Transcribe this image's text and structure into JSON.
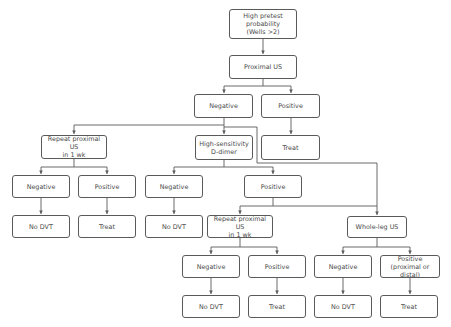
{
  "diagram": {
    "type": "flowchart",
    "line_color": "#5a5a5a",
    "text_color": "#4a4a4a",
    "nodes": [
      {
        "id": "start",
        "label": "High pretest\nprobability\n(Wells >2)",
        "x": 229,
        "y": 9,
        "w": 68,
        "h": 30
      },
      {
        "id": "proximal_us",
        "label": "Proximal US",
        "x": 229,
        "y": 55,
        "w": 68,
        "h": 24
      },
      {
        "id": "neg1",
        "label": "Negative",
        "x": 194,
        "y": 94,
        "w": 59,
        "h": 24
      },
      {
        "id": "pos1",
        "label": "Positive",
        "x": 261,
        "y": 94,
        "w": 59,
        "h": 24
      },
      {
        "id": "treat1",
        "label": "Treat",
        "x": 261,
        "y": 135,
        "w": 59,
        "h": 25
      },
      {
        "id": "repeat_us_a",
        "label": "Repeat proximal US\nin 1 wk",
        "x": 41,
        "y": 135,
        "w": 66,
        "h": 24
      },
      {
        "id": "ddimer",
        "label": "High-sensitivity\nD-dimer",
        "x": 195,
        "y": 135,
        "w": 58,
        "h": 25
      },
      {
        "id": "neg_a",
        "label": "Negative",
        "x": 12,
        "y": 175,
        "w": 58,
        "h": 23
      },
      {
        "id": "pos_a",
        "label": "Positive",
        "x": 78,
        "y": 175,
        "w": 58,
        "h": 23
      },
      {
        "id": "nodvt_a",
        "label": "No DVT",
        "x": 12,
        "y": 215,
        "w": 58,
        "h": 23
      },
      {
        "id": "treat_a",
        "label": "Treat",
        "x": 78,
        "y": 215,
        "w": 58,
        "h": 23
      },
      {
        "id": "neg_d",
        "label": "Negative",
        "x": 145,
        "y": 175,
        "w": 58,
        "h": 23
      },
      {
        "id": "pos_d",
        "label": "Positive",
        "x": 244,
        "y": 175,
        "w": 58,
        "h": 23
      },
      {
        "id": "nodvt_d",
        "label": "No DVT",
        "x": 145,
        "y": 215,
        "w": 58,
        "h": 23
      },
      {
        "id": "repeat_us_b",
        "label": "Repeat proximal US\nin 1 wk",
        "x": 207,
        "y": 215,
        "w": 66,
        "h": 23
      },
      {
        "id": "wholeleg",
        "label": "Whole-leg US",
        "x": 347,
        "y": 216,
        "w": 60,
        "h": 22
      },
      {
        "id": "neg_b",
        "label": "Negative",
        "x": 182,
        "y": 255,
        "w": 58,
        "h": 23
      },
      {
        "id": "pos_b",
        "label": "Positive",
        "x": 248,
        "y": 255,
        "w": 58,
        "h": 23
      },
      {
        "id": "nodvt_b",
        "label": "No DVT",
        "x": 182,
        "y": 295,
        "w": 58,
        "h": 23
      },
      {
        "id": "treat_b",
        "label": "Treat",
        "x": 248,
        "y": 295,
        "w": 58,
        "h": 23
      },
      {
        "id": "neg_w",
        "label": "Negative",
        "x": 314,
        "y": 255,
        "w": 58,
        "h": 23
      },
      {
        "id": "pos_w",
        "label": "Positive\n(proximal or distal)",
        "x": 380,
        "y": 255,
        "w": 60,
        "h": 23
      },
      {
        "id": "nodvt_w",
        "label": "No DVT",
        "x": 314,
        "y": 295,
        "w": 58,
        "h": 23
      },
      {
        "id": "treat_w",
        "label": "Treat",
        "x": 380,
        "y": 295,
        "w": 58,
        "h": 23
      }
    ],
    "edges": [
      {
        "from": "start",
        "to": "proximal_us"
      },
      {
        "from": "proximal_us",
        "to": "neg1"
      },
      {
        "from": "proximal_us",
        "to": "pos1"
      },
      {
        "from": "pos1",
        "to": "treat1"
      },
      {
        "from": "neg1",
        "to": "repeat_us_a"
      },
      {
        "from": "neg1",
        "to": "ddimer"
      },
      {
        "from": "neg1",
        "to": "wholeleg"
      },
      {
        "from": "repeat_us_a",
        "to": "neg_a"
      },
      {
        "from": "repeat_us_a",
        "to": "pos_a"
      },
      {
        "from": "neg_a",
        "to": "nodvt_a"
      },
      {
        "from": "pos_a",
        "to": "treat_a"
      },
      {
        "from": "ddimer",
        "to": "neg_d"
      },
      {
        "from": "ddimer",
        "to": "pos_d"
      },
      {
        "from": "neg_d",
        "to": "nodvt_d"
      },
      {
        "from": "pos_d",
        "to": "repeat_us_b"
      },
      {
        "from": "pos_d",
        "to": "wholeleg"
      },
      {
        "from": "repeat_us_b",
        "to": "neg_b"
      },
      {
        "from": "repeat_us_b",
        "to": "pos_b"
      },
      {
        "from": "neg_b",
        "to": "nodvt_b"
      },
      {
        "from": "pos_b",
        "to": "treat_b"
      },
      {
        "from": "wholeleg",
        "to": "neg_w"
      },
      {
        "from": "wholeleg",
        "to": "pos_w"
      },
      {
        "from": "neg_w",
        "to": "nodvt_w"
      },
      {
        "from": "pos_w",
        "to": "treat_w"
      }
    ],
    "connector_paths": [
      "M263,39 L263,54",
      "M263,79 L263,86 M224,86 L291,86 M224,86 L224,93 M291,86 L291,93",
      "M291,118 L291,134",
      "M224,118 L224,134",
      "M224,125 L74,125 L74,134",
      "M224,127 L257,127 L257,163 L377,163 L377,215",
      "M74,159 L74,167 M41,167 L107,167 M41,167 L41,174 M107,167 L107,174",
      "M41,198 L41,214",
      "M107,198 L107,214",
      "M224,160 L224,167 M174,167 L273,167 M174,167 L174,174 M273,167 L273,174",
      "M174,198 L174,214",
      "M273,198 L273,206 L240,206 L240,214 M273,206 L377,206",
      "M240,238 L240,247 M211,247 L277,247 M211,247 L211,254 M277,247 L277,254",
      "M211,278 L211,294",
      "M277,278 L277,294",
      "M377,238 L377,247 M343,247 L410,247 M343,247 L343,254 M410,247 L410,254",
      "M343,278 L343,294",
      "M410,278 L410,294"
    ],
    "arrow_tips": [
      [
        263,
        54
      ],
      [
        224,
        93
      ],
      [
        291,
        93
      ],
      [
        291,
        134
      ],
      [
        224,
        134
      ],
      [
        74,
        134
      ],
      [
        377,
        215
      ],
      [
        41,
        174
      ],
      [
        107,
        174
      ],
      [
        41,
        214
      ],
      [
        107,
        214
      ],
      [
        174,
        174
      ],
      [
        273,
        174
      ],
      [
        174,
        214
      ],
      [
        240,
        214
      ],
      [
        211,
        254
      ],
      [
        277,
        254
      ],
      [
        211,
        294
      ],
      [
        277,
        294
      ],
      [
        343,
        254
      ],
      [
        410,
        254
      ],
      [
        343,
        294
      ],
      [
        410,
        294
      ]
    ]
  }
}
